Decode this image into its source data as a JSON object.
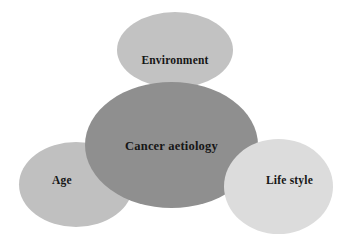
{
  "diagram": {
    "type": "venn-overlapping-ellipses",
    "background_color": "#ffffff",
    "text_color": "#161616",
    "title": "Cancer aetiology",
    "nodes": [
      {
        "id": "environment",
        "label": "Environment",
        "role": "contributing-factor",
        "position": "top",
        "fill_color": "#c2c2c2",
        "layer": 1
      },
      {
        "id": "age",
        "label": "Age",
        "role": "contributing-factor",
        "position": "bottom-left",
        "fill_color": "#c0c0c0",
        "layer": 2
      },
      {
        "id": "cancer-aetiology",
        "label": "Cancer aetiology",
        "role": "central-concept",
        "position": "center",
        "fill_color": "#8f8f8f",
        "layer": 3
      },
      {
        "id": "life-style",
        "label": "Life style",
        "role": "contributing-factor",
        "position": "bottom-right",
        "fill_color": "#dcdcdc",
        "layer": 4
      }
    ]
  }
}
